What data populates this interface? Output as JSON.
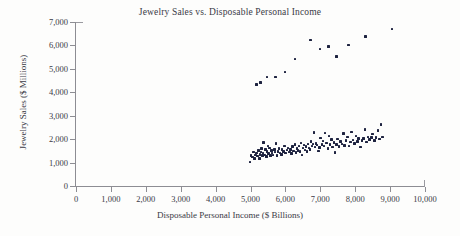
{
  "chart_data": {
    "type": "scatter",
    "title": "Jewelry Sales vs. Disposable Personal Income",
    "xlabel": "Disposable Personal Income ($ Billions)",
    "ylabel": "Jewelry Sales ($ Millions)",
    "xlim": [
      0,
      10000
    ],
    "ylim": [
      0,
      7000
    ],
    "xticks": [
      0,
      1000,
      2000,
      3000,
      4000,
      5000,
      6000,
      7000,
      8000,
      9000,
      10000
    ],
    "yticks": [
      0,
      1000,
      2000,
      3000,
      4000,
      5000,
      6000,
      7000
    ],
    "xtick_labels": [
      "0",
      "1,000",
      "2,000",
      "3,000",
      "4,000",
      "5,000",
      "6,000",
      "7,000",
      "8,000",
      "9,000",
      "10,000"
    ],
    "ytick_labels": [
      "0",
      "1,000",
      "2,000",
      "3,000",
      "4,000",
      "5,000",
      "6,000",
      "7,000"
    ],
    "grid": false,
    "legend": false,
    "marker_color": "#1e2340",
    "axis_color": "#8d8d93",
    "series": [
      {
        "name": "December (holiday) sales",
        "points": [
          [
            5180,
            4320
          ],
          [
            5290,
            4430
          ],
          [
            5470,
            4650
          ],
          [
            5720,
            4650
          ],
          [
            5990,
            4870
          ],
          [
            6270,
            5420
          ],
          [
            6720,
            6230
          ],
          [
            6990,
            5840
          ],
          [
            7230,
            5950
          ],
          [
            7470,
            5520
          ],
          [
            7800,
            6010
          ],
          [
            8290,
            6390
          ],
          [
            9060,
            6700
          ]
        ]
      },
      {
        "name": "Non-holiday monthly sales",
        "points": [
          [
            4980,
            1020
          ],
          [
            5020,
            1300
          ],
          [
            5060,
            1240
          ],
          [
            5090,
            1450
          ],
          [
            5120,
            1180
          ],
          [
            5150,
            1330
          ],
          [
            5180,
            1400
          ],
          [
            5200,
            1280
          ],
          [
            5230,
            1520
          ],
          [
            5250,
            1180
          ],
          [
            5270,
            1350
          ],
          [
            5300,
            1450
          ],
          [
            5320,
            1600
          ],
          [
            5340,
            1290
          ],
          [
            5360,
            1410
          ],
          [
            5380,
            1860
          ],
          [
            5400,
            1330
          ],
          [
            5430,
            1550
          ],
          [
            5450,
            1250
          ],
          [
            5470,
            1470
          ],
          [
            5500,
            1700
          ],
          [
            5520,
            1380
          ],
          [
            5550,
            1620
          ],
          [
            5570,
            1290
          ],
          [
            5600,
            1520
          ],
          [
            5620,
            1400
          ],
          [
            5650,
            1330
          ],
          [
            5680,
            1560
          ],
          [
            5700,
            1450
          ],
          [
            5730,
            1820
          ],
          [
            5760,
            1300
          ],
          [
            5790,
            1480
          ],
          [
            5820,
            1610
          ],
          [
            5850,
            1400
          ],
          [
            5880,
            1350
          ],
          [
            5900,
            1560
          ],
          [
            5950,
            1470
          ],
          [
            5980,
            1700
          ],
          [
            6010,
            1400
          ],
          [
            6050,
            1530
          ],
          [
            6080,
            1620
          ],
          [
            6120,
            1450
          ],
          [
            6150,
            1570
          ],
          [
            6180,
            1390
          ],
          [
            6210,
            1680
          ],
          [
            6240,
            1500
          ],
          [
            6270,
            1760
          ],
          [
            6300,
            1420
          ],
          [
            6330,
            1600
          ],
          [
            6360,
            1520
          ],
          [
            6390,
            1700
          ],
          [
            6420,
            1460
          ],
          [
            6450,
            1840
          ],
          [
            6470,
            1330
          ],
          [
            6500,
            1620
          ],
          [
            6530,
            1750
          ],
          [
            6560,
            1540
          ],
          [
            6590,
            1680
          ],
          [
            6620,
            1470
          ],
          [
            6650,
            1800
          ],
          [
            6680,
            1620
          ],
          [
            6700,
            1560
          ],
          [
            6730,
            1900
          ],
          [
            6760,
            1700
          ],
          [
            6790,
            1790
          ],
          [
            6820,
            2290
          ],
          [
            6850,
            1660
          ],
          [
            6880,
            1810
          ],
          [
            6910,
            1750
          ],
          [
            6950,
            1490
          ],
          [
            6980,
            1640
          ],
          [
            7010,
            2050
          ],
          [
            7050,
            1780
          ],
          [
            7080,
            1920
          ],
          [
            7110,
            1700
          ],
          [
            7140,
            2270
          ],
          [
            7180,
            1840
          ],
          [
            7220,
            1590
          ],
          [
            7250,
            2130
          ],
          [
            7280,
            1760
          ],
          [
            7320,
            1980
          ],
          [
            7350,
            1670
          ],
          [
            7390,
            1860
          ],
          [
            7420,
            1430
          ],
          [
            7460,
            1780
          ],
          [
            7500,
            2000
          ],
          [
            7540,
            1690
          ],
          [
            7580,
            1900
          ],
          [
            7620,
            1790
          ],
          [
            7660,
            2240
          ],
          [
            7700,
            1740
          ],
          [
            7740,
            1950
          ],
          [
            7780,
            2090
          ],
          [
            7820,
            1700
          ],
          [
            7860,
            1880
          ],
          [
            7900,
            2310
          ],
          [
            7940,
            1960
          ],
          [
            7980,
            1820
          ],
          [
            8020,
            2140
          ],
          [
            8060,
            1900
          ],
          [
            8100,
            2020
          ],
          [
            8150,
            1660
          ],
          [
            8190,
            1930
          ],
          [
            8240,
            2040
          ],
          [
            8280,
            2410
          ],
          [
            8320,
            1880
          ],
          [
            8370,
            2100
          ],
          [
            8410,
            1990
          ],
          [
            8460,
            2060
          ],
          [
            8500,
            2220
          ],
          [
            8550,
            1940
          ],
          [
            8600,
            2070
          ],
          [
            8650,
            2380
          ],
          [
            8700,
            2000
          ],
          [
            8740,
            2620
          ],
          [
            8780,
            2090
          ]
        ]
      }
    ]
  }
}
